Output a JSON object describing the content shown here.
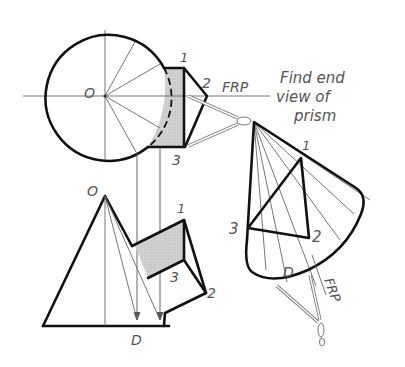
{
  "figure": {
    "type": "descriptive geometry drawing",
    "instruction": [
      "Find end",
      "view of",
      "prism"
    ],
    "colors": {
      "line": "#111111",
      "thin_line": "#666666",
      "label": "#555555",
      "shade": "#c8c8c8",
      "background": "#ffffff"
    }
  },
  "top_view": {
    "center_label": "O",
    "vertex_labels": {
      "v1": "1",
      "v2": "2",
      "v3": "3"
    },
    "reference_plane": "FRP"
  },
  "front_view": {
    "apex_label": "O",
    "vertex_labels": {
      "v1": "1",
      "v2": "2",
      "v3": "3"
    },
    "base_point_label": "D"
  },
  "auxiliary_view": {
    "vertex_labels": {
      "v1": "1",
      "v2": "2",
      "v3": "3"
    },
    "point_label": "D",
    "reference_plane": "FRP"
  }
}
